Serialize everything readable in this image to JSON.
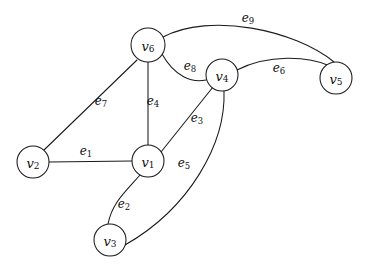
{
  "figure": {
    "type": "undirected-graph-diagram",
    "background_color": "#ffffff",
    "stroke_color": "#1a1a1a",
    "text_color": "#111111",
    "width": 365,
    "height": 271
  },
  "vertices": [
    {
      "id": "v6",
      "name": "v",
      "sub": "6",
      "cx": 148,
      "cy": 45,
      "r": 17
    },
    {
      "id": "v4",
      "name": "v",
      "sub": "4",
      "cx": 222,
      "cy": 75,
      "r": 16
    },
    {
      "id": "v5",
      "name": "v",
      "sub": "5",
      "cx": 336,
      "cy": 78,
      "r": 16
    },
    {
      "id": "v2",
      "name": "v",
      "sub": "2",
      "cx": 33,
      "cy": 162,
      "r": 16
    },
    {
      "id": "v1",
      "name": "v",
      "sub": "1",
      "cx": 148,
      "cy": 161,
      "r": 16
    },
    {
      "id": "v3",
      "name": "v",
      "sub": "3",
      "cx": 110,
      "cy": 240,
      "r": 16
    }
  ],
  "edges": [
    {
      "id": "e1",
      "name": "e",
      "sub": "1",
      "from": "v2",
      "to": "v1",
      "shape": "straight",
      "path": "M 49 162 L 132 161",
      "label_x": 86,
      "label_y": 151
    },
    {
      "id": "e2",
      "name": "e",
      "sub": "2",
      "from": "v1",
      "to": "v3",
      "shape": "curve",
      "path": "M 140 175 C 125 192 112 203 108 224",
      "label_x": 124,
      "label_y": 204
    },
    {
      "id": "e3",
      "name": "e",
      "sub": "3",
      "from": "v1",
      "to": "v4",
      "shape": "straight",
      "path": "M 161 152 L 213 87",
      "label_x": 197,
      "label_y": 118
    },
    {
      "id": "e4",
      "name": "e",
      "sub": "4",
      "from": "v6",
      "to": "v1",
      "shape": "straight",
      "path": "M 148 62 L 148 145",
      "label_x": 153,
      "label_y": 101
    },
    {
      "id": "e5",
      "name": "e",
      "sub": "5",
      "from": "v4",
      "to": "v3",
      "shape": "curve",
      "path": "M 224 91 C 226 143 190 208 125 245",
      "label_x": 184,
      "label_y": 163
    },
    {
      "id": "e6",
      "name": "e",
      "sub": "6",
      "from": "v4",
      "to": "v5",
      "shape": "curve",
      "path": "M 237 70 C 268 54 308 56 330 66",
      "label_x": 279,
      "label_y": 68
    },
    {
      "id": "e7",
      "name": "e",
      "sub": "7",
      "from": "v6",
      "to": "v2",
      "shape": "straight",
      "path": "M 137 60 L 44 150",
      "label_x": 101,
      "label_y": 101
    },
    {
      "id": "e8",
      "name": "e",
      "sub": "8",
      "from": "v6",
      "to": "v4",
      "shape": "curve",
      "path": "M 162 54 C 175 77 192 83 206 80",
      "label_x": 190,
      "label_y": 66
    },
    {
      "id": "e9",
      "name": "e",
      "sub": "9",
      "from": "v6",
      "to": "v5",
      "shape": "curve",
      "path": "M 163 37 C 210 12 295 30 334 62",
      "label_x": 248,
      "label_y": 18
    }
  ],
  "graph_summary": {
    "vertex_count": 6,
    "edge_count": 9,
    "adjacency": [
      {
        "edge": "e1",
        "endpoints": [
          "v2",
          "v1"
        ]
      },
      {
        "edge": "e2",
        "endpoints": [
          "v1",
          "v3"
        ]
      },
      {
        "edge": "e3",
        "endpoints": [
          "v1",
          "v4"
        ]
      },
      {
        "edge": "e4",
        "endpoints": [
          "v6",
          "v1"
        ]
      },
      {
        "edge": "e5",
        "endpoints": [
          "v4",
          "v3"
        ]
      },
      {
        "edge": "e6",
        "endpoints": [
          "v4",
          "v5"
        ]
      },
      {
        "edge": "e7",
        "endpoints": [
          "v6",
          "v2"
        ]
      },
      {
        "edge": "e8",
        "endpoints": [
          "v6",
          "v4"
        ]
      },
      {
        "edge": "e9",
        "endpoints": [
          "v6",
          "v5"
        ]
      }
    ]
  }
}
